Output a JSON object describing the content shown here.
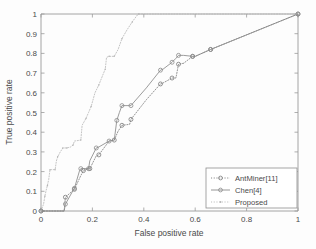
{
  "chart_data": {
    "type": "line",
    "title": "",
    "xlabel": "False positive rate",
    "ylabel": "True positive rate",
    "xlim": [
      0,
      1
    ],
    "ylim": [
      0,
      1
    ],
    "xticks": [
      "0",
      "0.2",
      "0.4",
      "0.6",
      "0.8",
      "1"
    ],
    "xtick_values": [
      0,
      0.2,
      0.4,
      0.6,
      0.8,
      1
    ],
    "yticks": [
      "0",
      "0.1",
      "0.2",
      "0.3",
      "0.4",
      "0.5",
      "0.6",
      "0.7",
      "0.8",
      "0.9",
      "1"
    ],
    "ytick_values": [
      0,
      0.1,
      0.2,
      0.3,
      0.4,
      0.5,
      0.6,
      0.7,
      0.8,
      0.9,
      1
    ],
    "grid": false,
    "legend_position": "lower right",
    "series": [
      {
        "name": "AntMiner[11]",
        "style": "dotted",
        "marker": "circle",
        "color": "#7a7a7a",
        "x": [
          0,
          0.09,
          0.095,
          0.125,
          0.13,
          0.155,
          0.165,
          0.185,
          0.19,
          0.215,
          0.225,
          0.265,
          0.285,
          0.3,
          0.315,
          0.345,
          0.35,
          0.41,
          0.465,
          0.475,
          0.51,
          0.525,
          0.535,
          0.555,
          0.59,
          0.6,
          0.66,
          1.0
        ],
        "y": [
          0,
          0.0,
          0.07,
          0.105,
          0.11,
          0.18,
          0.205,
          0.215,
          0.215,
          0.28,
          0.285,
          0.355,
          0.36,
          0.405,
          0.435,
          0.44,
          0.465,
          0.565,
          0.645,
          0.65,
          0.675,
          0.675,
          0.745,
          0.75,
          0.785,
          0.785,
          0.82,
          1.0
        ]
      },
      {
        "name": "Chen[4]",
        "style": "solid",
        "marker": "circle",
        "color": "#8a8a8a",
        "x": [
          0,
          0.09,
          0.095,
          0.125,
          0.13,
          0.15,
          0.155,
          0.165,
          0.185,
          0.19,
          0.215,
          0.225,
          0.265,
          0.285,
          0.295,
          0.305,
          0.315,
          0.345,
          0.35,
          0.41,
          0.465,
          0.475,
          0.51,
          0.525,
          0.535,
          0.555,
          0.59,
          0.6,
          0.66,
          1.0
        ],
        "y": [
          0,
          0.0,
          0.035,
          0.105,
          0.115,
          0.205,
          0.215,
          0.215,
          0.215,
          0.255,
          0.32,
          0.325,
          0.355,
          0.36,
          0.46,
          0.5,
          0.535,
          0.535,
          0.535,
          0.625,
          0.715,
          0.72,
          0.755,
          0.775,
          0.79,
          0.79,
          0.785,
          0.785,
          0.82,
          1.0
        ]
      },
      {
        "name": "Proposed",
        "style": "dotted",
        "marker": "dot",
        "color": "#b5b5b5",
        "x": [
          0,
          0.01,
          0.015,
          0.02,
          0.025,
          0.03,
          0.035,
          0.04,
          0.055,
          0.06,
          0.065,
          0.075,
          0.085,
          0.09,
          0.1,
          0.115,
          0.125,
          0.13,
          0.155,
          0.16,
          0.175,
          0.185,
          0.195,
          0.21,
          0.225,
          0.245,
          0.25,
          0.255,
          0.265,
          0.275,
          0.285,
          0.3,
          0.315,
          0.335,
          0.355,
          0.375,
          0.38,
          1.0
        ],
        "y": [
          0,
          0.035,
          0.075,
          0.105,
          0.13,
          0.16,
          0.21,
          0.21,
          0.21,
          0.255,
          0.275,
          0.3,
          0.32,
          0.32,
          0.32,
          0.325,
          0.335,
          0.355,
          0.36,
          0.435,
          0.47,
          0.5,
          0.53,
          0.6,
          0.64,
          0.705,
          0.72,
          0.78,
          0.785,
          0.785,
          0.785,
          0.82,
          0.875,
          0.92,
          0.96,
          0.995,
          1.0,
          1.0
        ]
      }
    ]
  },
  "legend": {
    "items": [
      {
        "label": "AntMiner[11]"
      },
      {
        "label": "Chen[4]"
      },
      {
        "label": "Proposed"
      }
    ]
  },
  "axes": {
    "x_label": "False positive rate",
    "y_label": "True positive rate"
  }
}
